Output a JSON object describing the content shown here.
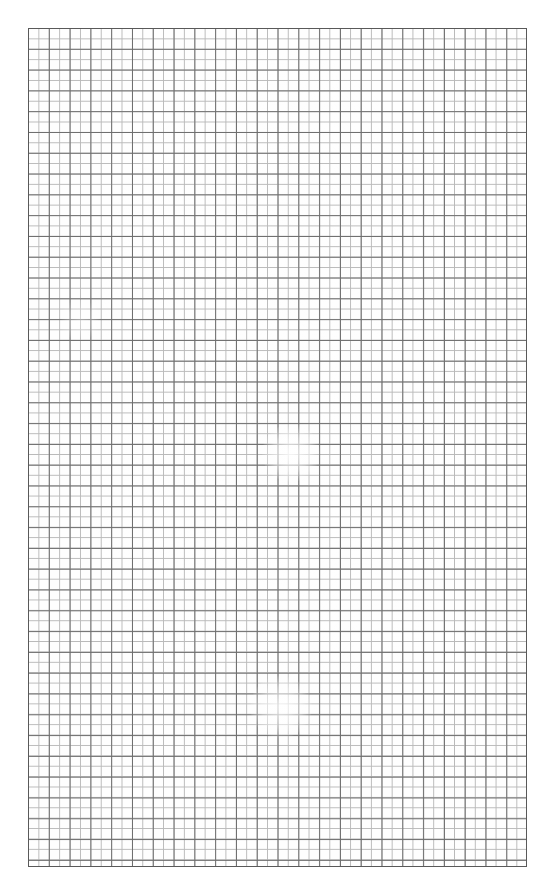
{
  "page": {
    "width": 556,
    "height": 895,
    "background_color": "#ffffff"
  },
  "sheet": {
    "name": "graph-paper-sheet",
    "left": 28,
    "top": 28,
    "width": 499,
    "height": 839,
    "paper_color": "#fefefe",
    "margin_color": "#ffffff"
  },
  "grid": {
    "cell_pitch_px": 10.4,
    "columns": 48,
    "rows": 81,
    "fine_line_color": "#b9b9b9",
    "fine_line_width_px": 1,
    "strong_line_color": "#6d6d6d",
    "strong_line_width_px": 1.4,
    "strong_line_every": 2,
    "frame_color": "#595959",
    "frame_width_px": 1.5,
    "orientation": "square"
  },
  "artifacts": [
    {
      "name": "scan-fade-upper",
      "left": 262,
      "top": 424,
      "width": 58,
      "height": 58,
      "strength": 0.85
    },
    {
      "name": "scan-fade-lower",
      "left": 250,
      "top": 676,
      "width": 62,
      "height": 62,
      "strength": 0.8
    },
    {
      "name": "scan-fade-faint-left",
      "left": 60,
      "top": 300,
      "width": 40,
      "height": 40,
      "strength": 0.35
    }
  ]
}
